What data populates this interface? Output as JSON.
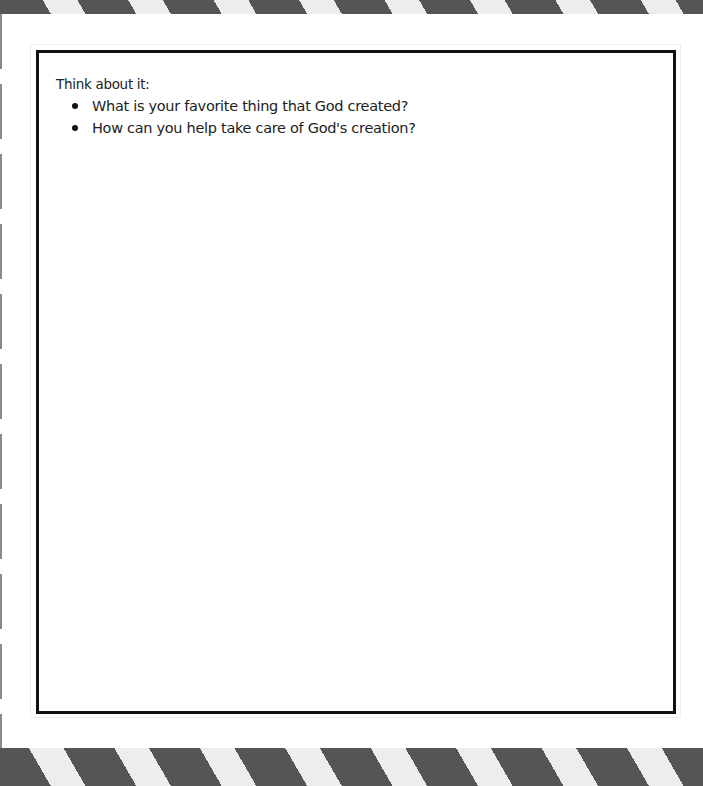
{
  "page": {
    "background": "#ffffff"
  },
  "decor": {
    "stripe_dark_color": "#555555",
    "stripe_light_color": "#ededed",
    "border_color": "#111111"
  },
  "worksheet": {
    "heading": "Think about it:",
    "questions": [
      {
        "text": "What is your favorite thing that God created?"
      },
      {
        "text": "How can you help take care of God's creation?"
      }
    ]
  }
}
